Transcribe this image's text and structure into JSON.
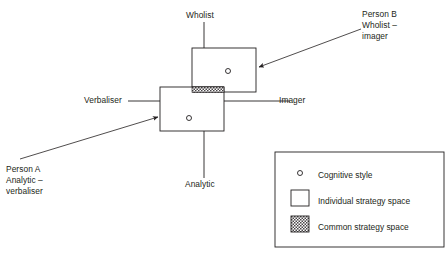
{
  "figure": {
    "type": "diagram"
  },
  "axes": {
    "vertical": {
      "top_label": "Wholist",
      "bottom_label": "Analytic"
    },
    "horizontal": {
      "left_label": "Verbaliser",
      "right_label": "Imager"
    }
  },
  "annotations": [
    {
      "id": "person-b",
      "lines": [
        "Person B",
        "Wholist –",
        "imager"
      ]
    },
    {
      "id": "person-a",
      "lines": [
        "Person A",
        "Analytic –",
        "verbaliser"
      ]
    }
  ],
  "legend": {
    "items": [
      {
        "symbol": "circle-marker",
        "label": "Cognitive style"
      },
      {
        "symbol": "open-square",
        "label": "Individual strategy space"
      },
      {
        "symbol": "hatched-square",
        "label": "Common strategy space"
      }
    ]
  },
  "colors": {
    "line": "#231f20",
    "text": "#231f20",
    "background": "#ffffff"
  }
}
